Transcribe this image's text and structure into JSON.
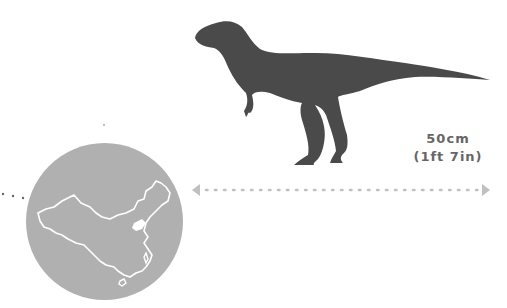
{
  "size": {
    "metric": "50cm",
    "imperial": "(1ft 7in)"
  },
  "location": {
    "country": "China",
    "highlight_region": "Shandong"
  },
  "colors": {
    "silhouette": "#4a4a4a",
    "circle": "#b0b0b0",
    "map_outline": "#ffffff",
    "arrow": "#c0c0c0",
    "text": "#666666"
  },
  "icons": {
    "dinosaur": "dinosaur-silhouette-icon",
    "map": "china-map-icon",
    "arrow_left": "arrow-left-icon",
    "arrow_right": "arrow-right-icon"
  }
}
